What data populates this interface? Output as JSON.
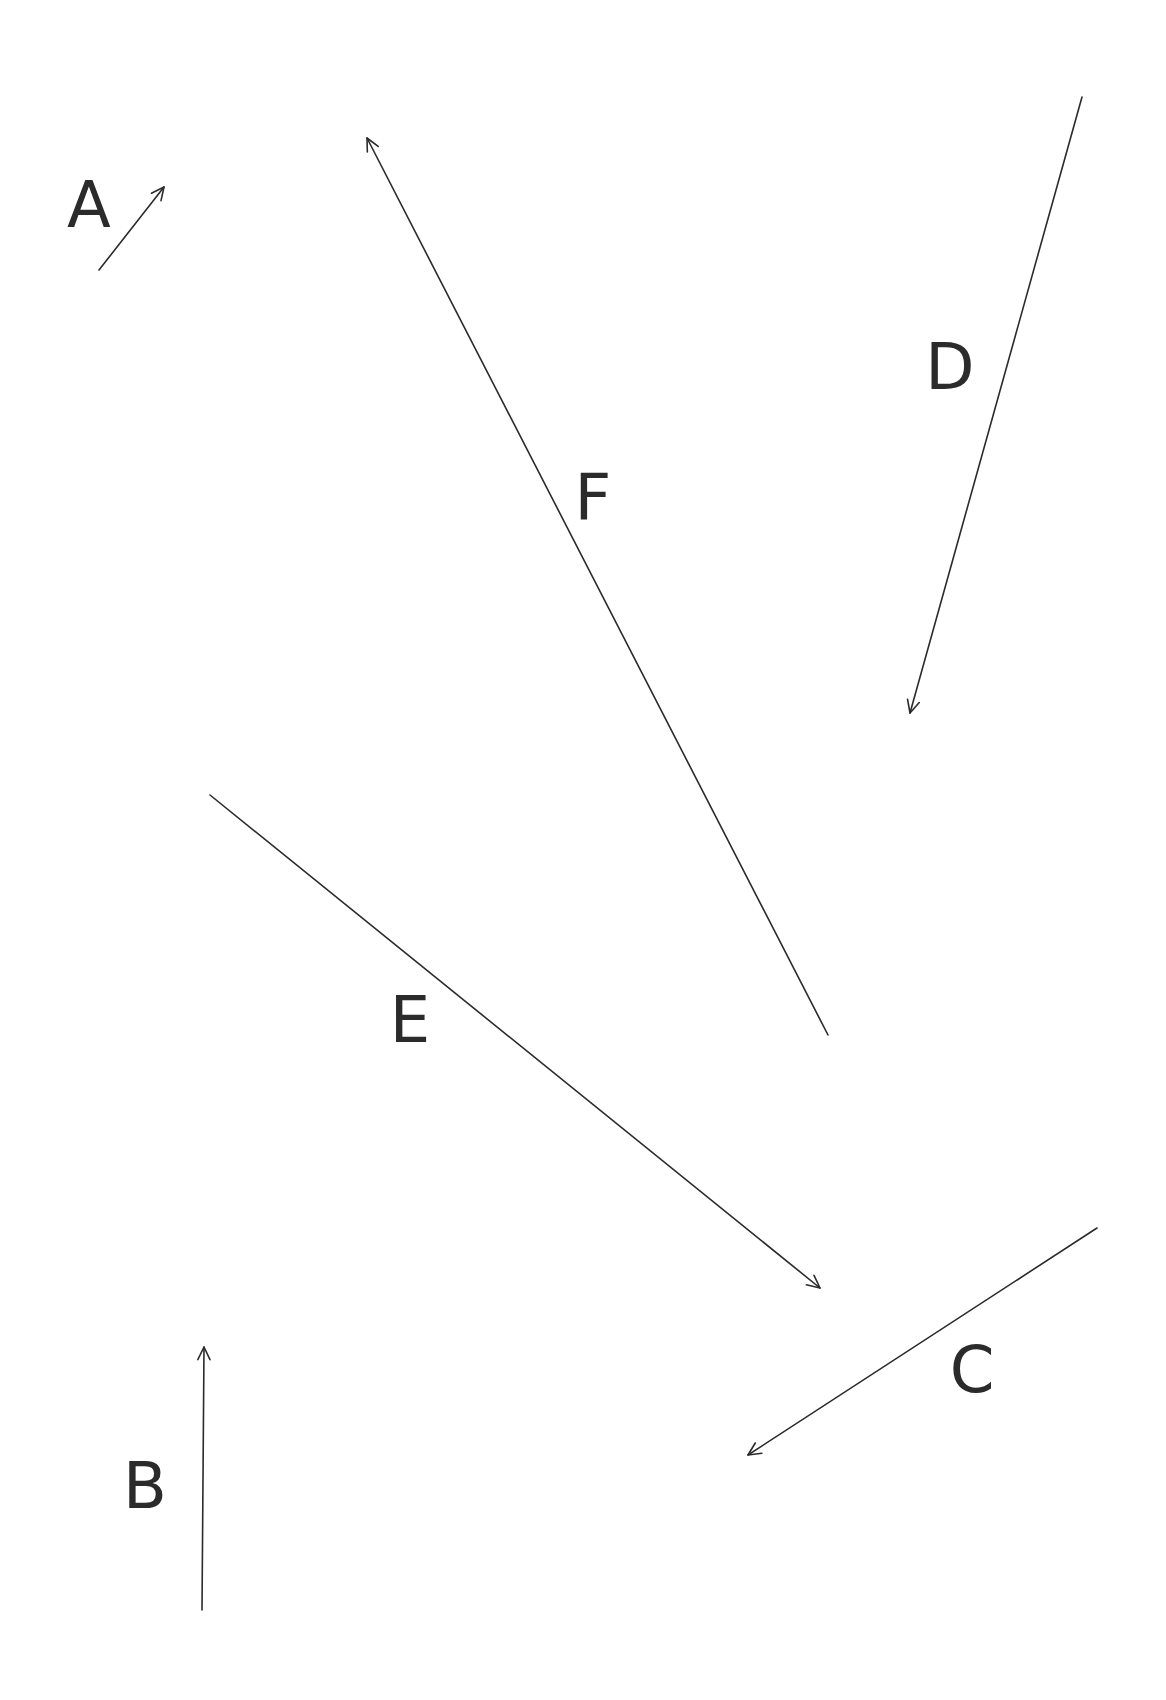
{
  "diagram": {
    "background": "#ffffff",
    "stroke_color": "#2b2b2b",
    "vectors": [
      {
        "id": "A",
        "label": "A",
        "tail": [
          99,
          270
        ],
        "head": [
          164,
          187
        ],
        "label_pos": [
          89,
          205
        ]
      },
      {
        "id": "B",
        "label": "B",
        "tail": [
          202,
          1610
        ],
        "head": [
          204,
          1347
        ],
        "label_pos": [
          145,
          1486
        ]
      },
      {
        "id": "C",
        "label": "C",
        "tail": [
          1097,
          1228
        ],
        "head": [
          748,
          1455
        ],
        "label_pos": [
          972,
          1370
        ]
      },
      {
        "id": "D",
        "label": "D",
        "tail": [
          1082,
          97
        ],
        "head": [
          910,
          713
        ],
        "label_pos": [
          950,
          367
        ]
      },
      {
        "id": "E",
        "label": "E",
        "tail": [
          210,
          795
        ],
        "head": [
          820,
          1288
        ],
        "label_pos": [
          410,
          1020
        ]
      },
      {
        "id": "F",
        "label": "F",
        "tail": [
          828,
          1035
        ],
        "head": [
          367,
          138
        ],
        "label_pos": [
          593,
          497
        ]
      }
    ]
  }
}
